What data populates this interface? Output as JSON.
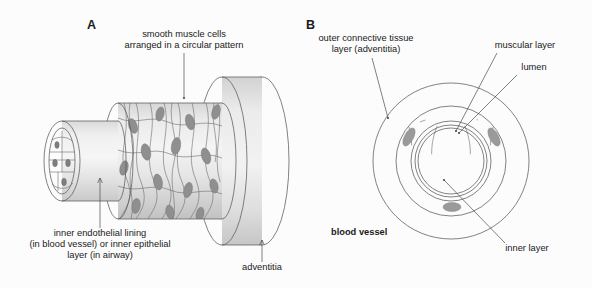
{
  "figure": {
    "background_color": "#fcfcfc",
    "panels": [
      {
        "letter": "A",
        "name": "longitudinal-cutaway-view"
      },
      {
        "letter": "B",
        "name": "cross-section-view"
      }
    ]
  },
  "labels": {
    "panel_a_letter": "A",
    "panel_b_letter": "B",
    "smooth_muscle_line1": "smooth muscle cells",
    "smooth_muscle_line2": "arranged in a circular pattern",
    "inner_endothelial_line1": "inner endothelial lining",
    "inner_endothelial_line2": "(in blood vessel) or inner epithelial",
    "inner_endothelial_line3": "layer (in airway)",
    "adventitia": "adventitia",
    "outer_connective_line1": "outer connective tissue",
    "outer_connective_line2": "layer (adventitia)",
    "muscular_layer": "muscular layer",
    "lumen": "lumen",
    "inner_layer": "inner layer",
    "blood_vessel": "blood vessel"
  },
  "colors": {
    "background": "#fcfcfc",
    "tissue_light": "#e8e8e8",
    "tissue_pale": "#efefef",
    "tissue_mid": "#d2d2d2",
    "tissue_dark": "#bdbdbd",
    "muscular_ring": "#c6c6c6",
    "adventitia_ring": "#dcdcdc",
    "lumen_fill": "#ffffff",
    "nucleus": "#8f8f8f",
    "outline": "#5a5a5a",
    "leader": "#4a4a4a",
    "text": "#1a1a1a"
  }
}
